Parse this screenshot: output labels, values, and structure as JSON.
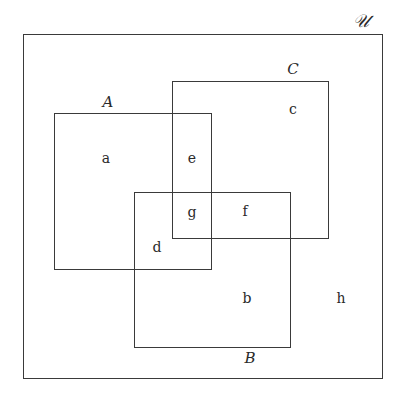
{
  "diagram": {
    "type": "venn-rectangles",
    "universe": {
      "label": "𝒰",
      "box": {
        "x": 23,
        "y": 34,
        "w": 360,
        "h": 345
      },
      "label_pos": {
        "x": 361,
        "y": 21
      }
    },
    "sets": [
      {
        "id": "A",
        "label": "A",
        "box": {
          "x": 54,
          "y": 113,
          "w": 158,
          "h": 157
        },
        "label_pos": {
          "x": 108,
          "y": 102
        }
      },
      {
        "id": "C",
        "label": "C",
        "box": {
          "x": 172,
          "y": 81,
          "w": 157,
          "h": 158
        },
        "label_pos": {
          "x": 293,
          "y": 69
        }
      },
      {
        "id": "B",
        "label": "B",
        "box": {
          "x": 134,
          "y": 192,
          "w": 157,
          "h": 156
        },
        "label_pos": {
          "x": 250,
          "y": 358
        }
      }
    ],
    "regions": [
      {
        "id": "a",
        "label": "a",
        "pos": {
          "x": 106,
          "y": 158
        }
      },
      {
        "id": "e",
        "label": "e",
        "pos": {
          "x": 192,
          "y": 158
        }
      },
      {
        "id": "c",
        "label": "c",
        "pos": {
          "x": 293,
          "y": 109
        }
      },
      {
        "id": "g",
        "label": "g",
        "pos": {
          "x": 192,
          "y": 212
        }
      },
      {
        "id": "f",
        "label": "f",
        "pos": {
          "x": 245,
          "y": 211
        }
      },
      {
        "id": "d",
        "label": "d",
        "pos": {
          "x": 157,
          "y": 247
        }
      },
      {
        "id": "b",
        "label": "b",
        "pos": {
          "x": 247,
          "y": 298
        }
      },
      {
        "id": "h",
        "label": "h",
        "pos": {
          "x": 341,
          "y": 298
        }
      }
    ],
    "colors": {
      "stroke": "#3a3a3a",
      "text": "#2a2a2a",
      "background": "#ffffff"
    }
  }
}
